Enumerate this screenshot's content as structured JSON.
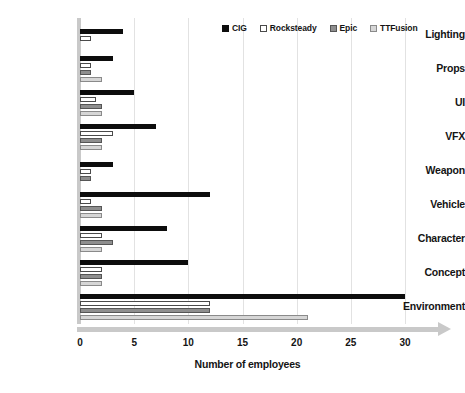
{
  "chart_data": {
    "type": "bar",
    "orientation": "horizontal",
    "title": "",
    "xlabel": "Number of employees",
    "ylabel": "",
    "xlim": [
      0,
      30
    ],
    "xticks": [
      0,
      5,
      10,
      15,
      20,
      25,
      30
    ],
    "xtick_labels": [
      "0",
      "5",
      "10",
      "15",
      "20",
      "25",
      "30"
    ],
    "grid": "vertical",
    "legend_position": "top-right",
    "categories": [
      "Lighting",
      "Props",
      "UI",
      "VFX",
      "Weapon",
      "Vehicle",
      "Character",
      "Concept",
      "Environment"
    ],
    "series": [
      {
        "name": "CIG",
        "color": "#0d0d0d",
        "values": [
          4,
          3,
          5,
          7,
          3,
          12,
          8,
          10,
          30
        ]
      },
      {
        "name": "Rocksteady",
        "color": "#ffffff",
        "values": [
          1,
          1,
          1.5,
          3,
          1,
          1,
          2,
          2,
          12
        ]
      },
      {
        "name": "Epic",
        "color": "#8e8e8e",
        "values": [
          0,
          1,
          2,
          2,
          1,
          2,
          3,
          2,
          12
        ]
      },
      {
        "name": "TTFusion",
        "color": "#d6d6d6",
        "values": [
          0,
          2,
          2,
          2,
          0,
          2,
          2,
          2,
          21
        ]
      }
    ]
  },
  "legend": {
    "items": [
      {
        "label": "CIG",
        "swatch": "legend-swatch-filled-black"
      },
      {
        "label": "Rocksteady",
        "swatch": "legend-swatch-outlined-white"
      },
      {
        "label": "Epic",
        "swatch": "legend-swatch-filled-gray"
      },
      {
        "label": "TTFusion",
        "swatch": "legend-swatch-filled-lightgray"
      }
    ]
  }
}
